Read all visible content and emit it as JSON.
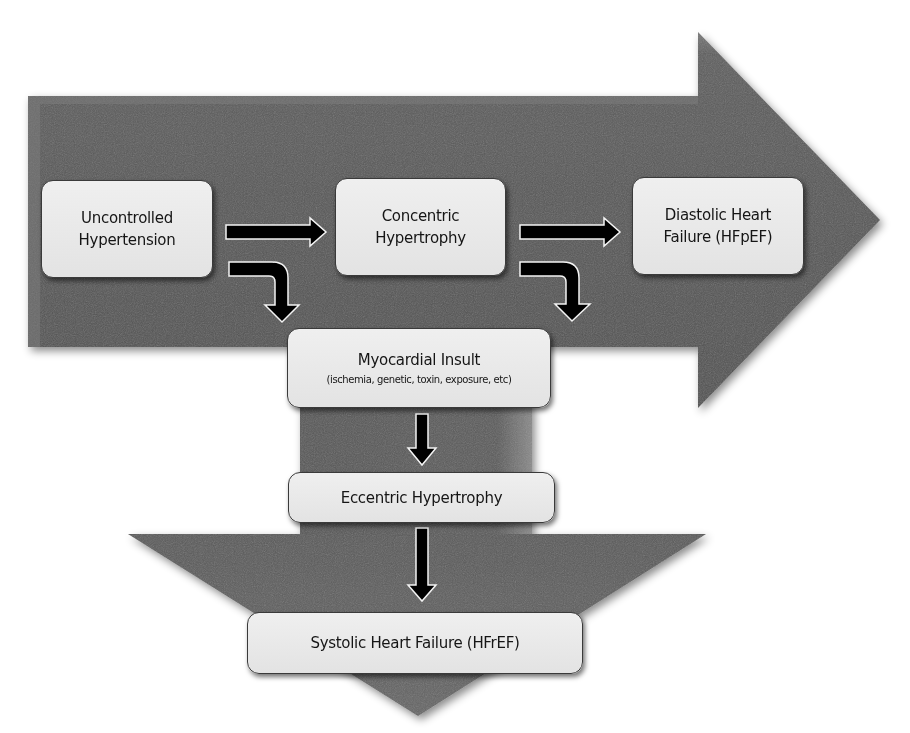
{
  "diagram": {
    "type": "flowchart",
    "colors": {
      "arrow_body": "#565656",
      "arrow_highlight": "#7a7a7a",
      "box_fill": "#e8e8e8",
      "box_border": "#3a3a3a",
      "connector": "#000000",
      "connector_outline": "#ffffff",
      "text": "#151515",
      "background": "#ffffff"
    },
    "nodes": [
      {
        "id": "uncontrolled-hypertension",
        "lines": [
          "Uncontrolled",
          "Hypertension"
        ]
      },
      {
        "id": "concentric-hypertrophy",
        "lines": [
          "Concentric",
          "Hypertrophy"
        ]
      },
      {
        "id": "diastolic-heart-failure",
        "lines": [
          "Diastolic Heart",
          "Failure (HFpEF)"
        ]
      },
      {
        "id": "myocardial-insult",
        "lines": [
          "Myocardial Insult"
        ],
        "subtitle": "(ischemia, genetic, toxin, exposure, etc)"
      },
      {
        "id": "eccentric-hypertrophy",
        "lines": [
          "Eccentric Hypertrophy"
        ]
      },
      {
        "id": "systolic-heart-failure",
        "lines": [
          "Systolic Heart Failure (HFrEF)"
        ]
      }
    ],
    "edges": [
      {
        "from": "uncontrolled-hypertension",
        "to": "concentric-hypertrophy",
        "style": "straight-right"
      },
      {
        "from": "concentric-hypertrophy",
        "to": "diastolic-heart-failure",
        "style": "straight-right"
      },
      {
        "from": "uncontrolled-hypertension",
        "to": "myocardial-insult",
        "style": "bent-down"
      },
      {
        "from": "concentric-hypertrophy",
        "to": "myocardial-insult",
        "style": "bent-down"
      },
      {
        "from": "myocardial-insult",
        "to": "eccentric-hypertrophy",
        "style": "straight-down"
      },
      {
        "from": "eccentric-hypertrophy",
        "to": "systolic-heart-failure",
        "style": "straight-down"
      }
    ],
    "background_arrows": [
      {
        "name": "horizontal-progression-arrow",
        "direction": "right"
      },
      {
        "name": "vertical-progression-arrow",
        "direction": "down"
      }
    ]
  }
}
